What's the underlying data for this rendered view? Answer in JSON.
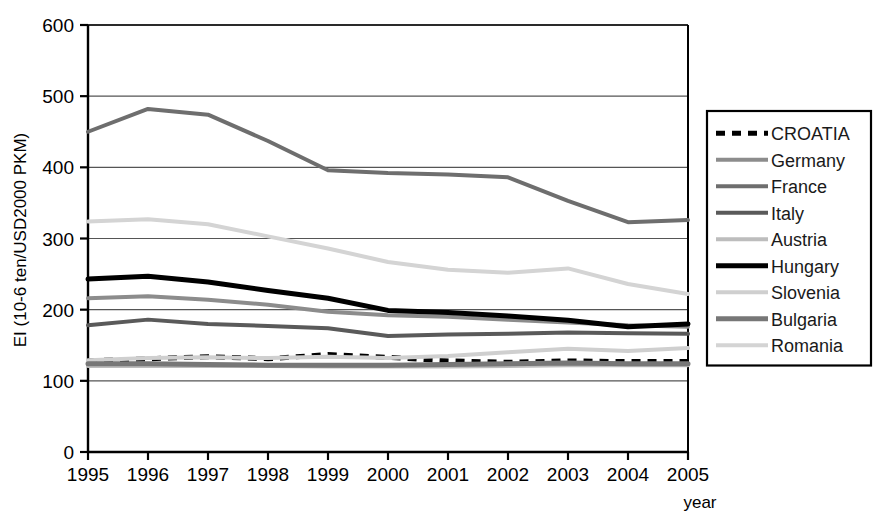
{
  "chart_data": {
    "type": "line",
    "title": "",
    "xlabel": "year",
    "ylabel": "EI (10-6 ten/USD2000 PKM)",
    "x": [
      1995,
      1996,
      1997,
      1998,
      1999,
      2000,
      2001,
      2002,
      2003,
      2004,
      2005
    ],
    "categories": [
      "1995",
      "1996",
      "1997",
      "1998",
      "1999",
      "2000",
      "2001",
      "2002",
      "2003",
      "2004",
      "2005"
    ],
    "ylim": [
      0,
      600
    ],
    "yticks": [
      0,
      100,
      200,
      300,
      400,
      500,
      600
    ],
    "grid": true,
    "legend_position": "right-outside",
    "series": [
      {
        "name": "CROATIA",
        "color": "#000000",
        "width": 5,
        "dash": "9,7",
        "values": [
          128,
          131,
          134,
          131,
          137,
          133,
          128,
          126,
          128,
          127,
          127
        ]
      },
      {
        "name": "Germany",
        "color": "#8c8c8c",
        "width": 4,
        "dash": "none",
        "values": [
          216,
          219,
          214,
          207,
          197,
          192,
          190,
          186,
          182,
          178,
          176
        ]
      },
      {
        "name": "France",
        "color": "#6e6e6e",
        "width": 4,
        "dash": "none",
        "values": [
          450,
          482,
          474,
          437,
          396,
          392,
          390,
          386,
          353,
          323,
          326
        ]
      },
      {
        "name": "Italy",
        "color": "#5a5a5a",
        "width": 4,
        "dash": "none",
        "values": [
          178,
          186,
          180,
          177,
          174,
          163,
          165,
          166,
          168,
          167,
          166
        ]
      },
      {
        "name": "Austria",
        "color": "#bdbdbd",
        "width": 4,
        "dash": "none",
        "values": [
          121,
          121,
          121,
          121,
          120,
          120,
          120,
          121,
          122,
          122,
          122
        ]
      },
      {
        "name": "Hungary",
        "color": "#000000",
        "width": 5,
        "dash": "none",
        "values": [
          243,
          247,
          239,
          227,
          216,
          199,
          196,
          191,
          185,
          176,
          180
        ]
      },
      {
        "name": "Slovenia",
        "color": "#cfcfcf",
        "width": 4,
        "dash": "none",
        "values": [
          129,
          132,
          133,
          132,
          134,
          132,
          135,
          140,
          145,
          142,
          146
        ]
      },
      {
        "name": "Bulgaria",
        "color": "#777777",
        "width": 5,
        "dash": "none",
        "values": [
          124,
          124,
          123,
          122,
          122,
          122,
          123,
          124,
          125,
          124,
          124
        ]
      },
      {
        "name": "Romania",
        "color": "#d4d4d4",
        "width": 4,
        "dash": "none",
        "values": [
          324,
          327,
          320,
          303,
          286,
          267,
          256,
          252,
          258,
          236,
          222
        ]
      }
    ]
  },
  "legend": {
    "items": [
      {
        "label": "CROATIA"
      },
      {
        "label": "Germany"
      },
      {
        "label": "France"
      },
      {
        "label": "Italy"
      },
      {
        "label": "Austria"
      },
      {
        "label": "Hungary"
      },
      {
        "label": "Slovenia"
      },
      {
        "label": "Bulgaria"
      },
      {
        "label": "Romania"
      }
    ]
  },
  "axes": {
    "y_title": "EI (10-6 ten/USD2000 PKM)",
    "x_title": "year",
    "y_tick_labels": [
      "600",
      "500",
      "400",
      "300",
      "200",
      "100",
      "0"
    ],
    "x_tick_labels": [
      "1995",
      "1996",
      "1997",
      "1998",
      "1999",
      "2000",
      "2001",
      "2002",
      "2003",
      "2004",
      "2005"
    ]
  },
  "colors": {
    "axis": "#000000",
    "grid": "#555555",
    "background": "#ffffff"
  }
}
